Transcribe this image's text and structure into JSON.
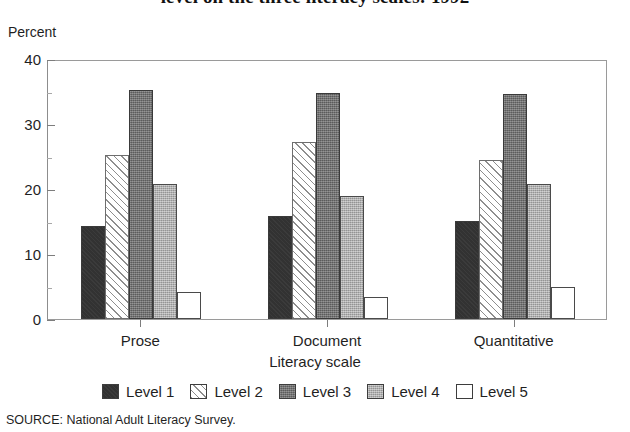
{
  "chart_data": {
    "type": "bar",
    "title": "level on the three literacy scales: 1992",
    "subtitle": "",
    "xlabel": "Literacy scale",
    "ylabel": "Percent",
    "ylim": [
      0,
      40
    ],
    "yticks": [
      0,
      10,
      20,
      30,
      40
    ],
    "ytick_labels": [
      "0",
      "10",
      "20",
      "30",
      "40"
    ],
    "y_minor_ticks": [
      5,
      15,
      25,
      35
    ],
    "grid": false,
    "legend_position": "bottom",
    "categories": [
      "Prose",
      "Document",
      "Quantitative"
    ],
    "series": [
      {
        "name": "Level 1",
        "values": [
          14.3,
          15.8,
          15.1
        ],
        "fill": "solid-dark",
        "color": "#323232"
      },
      {
        "name": "Level 2",
        "values": [
          25.2,
          27.2,
          24.5
        ],
        "fill": "diagonal-hatch",
        "color": "#fbfbfb"
      },
      {
        "name": "Level 3",
        "values": [
          35.2,
          34.7,
          34.6
        ],
        "fill": "dark-stipple",
        "color": "#6e6e6e"
      },
      {
        "name": "Level 4",
        "values": [
          20.8,
          19.0,
          20.8
        ],
        "fill": "light-stipple",
        "color": "#a9a9a9"
      },
      {
        "name": "Level 5",
        "values": [
          4.1,
          3.4,
          5.0
        ],
        "fill": "empty",
        "color": "#ffffff"
      }
    ]
  },
  "source": {
    "label": "SOURCE:",
    "text": "National Adult Literacy Survey.",
    "full": "SOURCE:  National Adult Literacy Survey."
  },
  "colors": {
    "level1": "#323232",
    "level2": "#fbfbfb",
    "level3": "#6e6e6e",
    "level4": "#a9a9a9",
    "level5": "#ffffff",
    "axis": "#8d8d8d",
    "text": "#1f1f1f"
  }
}
